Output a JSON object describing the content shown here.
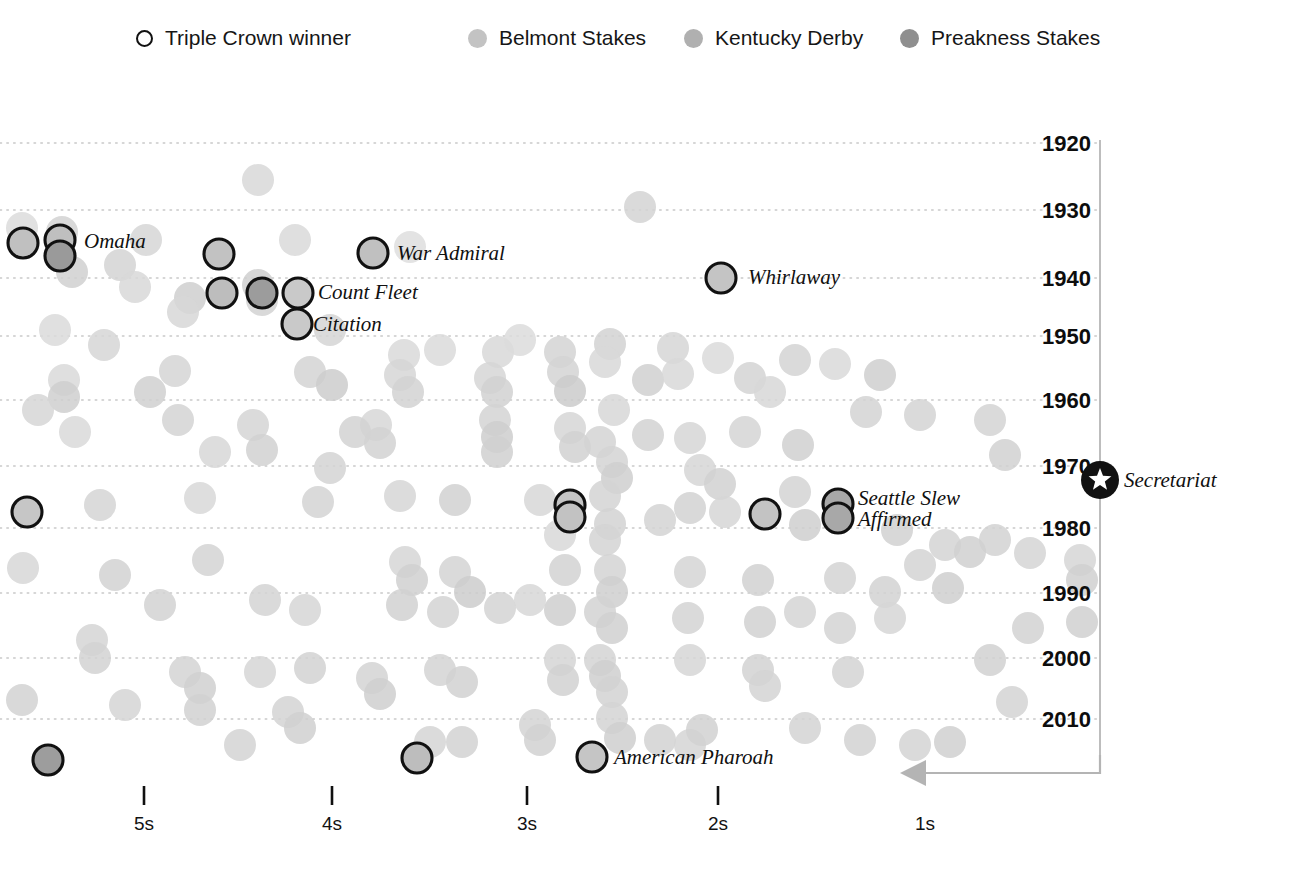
{
  "legend": {
    "items": [
      {
        "name": "triple-crown-winner",
        "label": "Triple Crown winner",
        "marker": "ring",
        "color": "#ffffff",
        "x": 136
      },
      {
        "name": "belmont-stakes",
        "label": "Belmont Stakes",
        "marker": "dot",
        "color": "#c3c3c3",
        "x": 468
      },
      {
        "name": "kentucky-derby",
        "label": "Kentucky Derby",
        "marker": "dot",
        "color": "#b0b0b0",
        "x": 684
      },
      {
        "name": "preakness-stakes",
        "label": "Preakness Stakes",
        "marker": "dot",
        "color": "#8f8f8f",
        "x": 900
      }
    ]
  },
  "chart_data": {
    "type": "scatter",
    "title": "",
    "xlabel": "",
    "ylabel": "",
    "grid": true,
    "legend_position": "top",
    "x_axis": {
      "ticks": [
        {
          "label": "5s",
          "x": 144,
          "has_tick": true
        },
        {
          "label": "4s",
          "x": 332,
          "has_tick": true
        },
        {
          "label": "3s",
          "x": 527,
          "has_tick": true
        },
        {
          "label": "2s",
          "x": 718,
          "has_tick": true
        },
        {
          "label": "1s",
          "x": 925,
          "has_tick": false
        }
      ],
      "tick_y_top": 786,
      "tick_y_bottom": 805,
      "label_y": 830,
      "direction_note": "seconds slower than record; decreasing to the right"
    },
    "y_axis": {
      "ticks": [
        {
          "label": "1920",
          "y": 143
        },
        {
          "label": "1930",
          "y": 210
        },
        {
          "label": "1940",
          "y": 278
        },
        {
          "label": "1950",
          "y": 336
        },
        {
          "label": "1960",
          "y": 400
        },
        {
          "label": "1970",
          "y": 466
        },
        {
          "label": "1980",
          "y": 528
        },
        {
          "label": "1990",
          "y": 593
        },
        {
          "label": "2000",
          "y": 658
        },
        {
          "label": "2010",
          "y": 719
        }
      ],
      "label_x": 1042,
      "axis_line_x": 1100,
      "axis_top": 140,
      "axis_bottom": 766
    },
    "series": [
      {
        "name": "Belmont Stakes",
        "color": "#c3c3c3"
      },
      {
        "name": "Kentucky Derby",
        "color": "#b0b0b0"
      },
      {
        "name": "Preakness Stakes",
        "color": "#8f8f8f"
      }
    ],
    "points": [
      [
        258,
        180,
        "#d8d8d8"
      ],
      [
        640,
        207,
        "#d3d3d3"
      ],
      [
        22,
        228,
        "#dcdcdc"
      ],
      [
        62,
        232,
        "#d2d2d2"
      ],
      [
        146,
        240,
        "#d6d6d6"
      ],
      [
        295,
        240,
        "#d9d9d9"
      ],
      [
        410,
        247,
        "#dedede"
      ],
      [
        120,
        265,
        "#d4d4d4"
      ],
      [
        72,
        272,
        "#d0d0d0"
      ],
      [
        135,
        287,
        "#d8d8d8"
      ],
      [
        190,
        298,
        "#cfcfcf"
      ],
      [
        183,
        312,
        "#d7d7d7"
      ],
      [
        258,
        285,
        "#cfcfcf"
      ],
      [
        262,
        300,
        "#d2d2d2"
      ],
      [
        55,
        330,
        "#dbdbdb"
      ],
      [
        104,
        345,
        "#d6d6d6"
      ],
      [
        330,
        330,
        "#d5d5d5"
      ],
      [
        404,
        355,
        "#d9d9d9"
      ],
      [
        440,
        350,
        "#dadada"
      ],
      [
        498,
        352,
        "#d8d8d8"
      ],
      [
        560,
        352,
        "#d3d3d3"
      ],
      [
        520,
        340,
        "#dcdcdc"
      ],
      [
        610,
        344,
        "#d2d2d2"
      ],
      [
        605,
        362,
        "#d8d8d8"
      ],
      [
        673,
        348,
        "#d6d6d6"
      ],
      [
        718,
        358,
        "#dadada"
      ],
      [
        795,
        360,
        "#d4d4d4"
      ],
      [
        835,
        364,
        "#d9d9d9"
      ],
      [
        64,
        380,
        "#d9d9d9"
      ],
      [
        64,
        397,
        "#cfcfcf"
      ],
      [
        150,
        392,
        "#d0d0d0"
      ],
      [
        175,
        371,
        "#d5d5d5"
      ],
      [
        310,
        372,
        "#d4d4d4"
      ],
      [
        332,
        385,
        "#cdcdcd"
      ],
      [
        400,
        375,
        "#d6d6d6"
      ],
      [
        408,
        392,
        "#d2d2d2"
      ],
      [
        490,
        378,
        "#d6d6d6"
      ],
      [
        497,
        392,
        "#d1d1d1"
      ],
      [
        563,
        372,
        "#d3d3d3"
      ],
      [
        570,
        391,
        "#cbcbcb"
      ],
      [
        648,
        380,
        "#d0d0d0"
      ],
      [
        678,
        374,
        "#d8d8d8"
      ],
      [
        750,
        378,
        "#d3d3d3"
      ],
      [
        770,
        392,
        "#d7d7d7"
      ],
      [
        880,
        375,
        "#cfcfcf"
      ],
      [
        920,
        415,
        "#d3d3d3"
      ],
      [
        990,
        420,
        "#d4d4d4"
      ],
      [
        178,
        420,
        "#d3d3d3"
      ],
      [
        75,
        432,
        "#d9d9d9"
      ],
      [
        253,
        425,
        "#d5d5d5"
      ],
      [
        262,
        450,
        "#d1d1d1"
      ],
      [
        376,
        425,
        "#d7d7d7"
      ],
      [
        380,
        443,
        "#d2d2d2"
      ],
      [
        495,
        420,
        "#d3d3d3"
      ],
      [
        497,
        437,
        "#cecece"
      ],
      [
        497,
        452,
        "#d0d0d0"
      ],
      [
        570,
        428,
        "#d6d6d6"
      ],
      [
        575,
        447,
        "#d1d1d1"
      ],
      [
        600,
        442,
        "#d4d4d4"
      ],
      [
        648,
        435,
        "#d2d2d2"
      ],
      [
        690,
        438,
        "#d6d6d6"
      ],
      [
        745,
        432,
        "#d5d5d5"
      ],
      [
        798,
        445,
        "#d0d0d0"
      ],
      [
        614,
        410,
        "#d7d7d7"
      ],
      [
        612,
        462,
        "#d3d3d3"
      ],
      [
        617,
        478,
        "#cfcfcf"
      ],
      [
        700,
        470,
        "#d6d6d6"
      ],
      [
        720,
        484,
        "#d1d1d1"
      ],
      [
        795,
        492,
        "#d3d3d3"
      ],
      [
        605,
        496,
        "#d4d4d4"
      ],
      [
        690,
        508,
        "#d2d2d2"
      ],
      [
        725,
        512,
        "#d6d6d6"
      ],
      [
        200,
        498,
        "#d8d8d8"
      ],
      [
        318,
        502,
        "#d3d3d3"
      ],
      [
        400,
        496,
        "#d6d6d6"
      ],
      [
        455,
        500,
        "#d1d1d1"
      ],
      [
        540,
        500,
        "#d7d7d7"
      ],
      [
        100,
        505,
        "#d5d5d5"
      ],
      [
        660,
        520,
        "#d3d3d3"
      ],
      [
        610,
        524,
        "#d2d2d2"
      ],
      [
        805,
        525,
        "#cfcfcf"
      ],
      [
        897,
        530,
        "#d1d1d1"
      ],
      [
        605,
        540,
        "#d4d4d4"
      ],
      [
        560,
        535,
        "#d8d8d8"
      ],
      [
        945,
        545,
        "#d4d4d4"
      ],
      [
        995,
        540,
        "#d2d2d2"
      ],
      [
        1030,
        553,
        "#d5d5d5"
      ],
      [
        920,
        565,
        "#d3d3d3"
      ],
      [
        970,
        552,
        "#d0d0d0"
      ],
      [
        23,
        568,
        "#d7d7d7"
      ],
      [
        115,
        575,
        "#d2d2d2"
      ],
      [
        208,
        560,
        "#d4d4d4"
      ],
      [
        405,
        562,
        "#d6d6d6"
      ],
      [
        412,
        580,
        "#d0d0d0"
      ],
      [
        455,
        572,
        "#d3d3d3"
      ],
      [
        470,
        592,
        "#cdcdcd"
      ],
      [
        565,
        570,
        "#d2d2d2"
      ],
      [
        610,
        570,
        "#d4d4d4"
      ],
      [
        612,
        592,
        "#cfcfcf"
      ],
      [
        690,
        572,
        "#d5d5d5"
      ],
      [
        758,
        580,
        "#d1d1d1"
      ],
      [
        840,
        578,
        "#d4d4d4"
      ],
      [
        885,
        592,
        "#d2d2d2"
      ],
      [
        948,
        588,
        "#cfcfcf"
      ],
      [
        1080,
        560,
        "#d6d6d6"
      ],
      [
        1082,
        580,
        "#d0d0d0"
      ],
      [
        160,
        605,
        "#d2d2d2"
      ],
      [
        265,
        600,
        "#d4d4d4"
      ],
      [
        305,
        610,
        "#d6d6d6"
      ],
      [
        402,
        605,
        "#d1d1d1"
      ],
      [
        443,
        612,
        "#d4d4d4"
      ],
      [
        500,
        608,
        "#d3d3d3"
      ],
      [
        530,
        600,
        "#d7d7d7"
      ],
      [
        560,
        610,
        "#cfcfcf"
      ],
      [
        600,
        612,
        "#d2d2d2"
      ],
      [
        612,
        628,
        "#d0d0d0"
      ],
      [
        688,
        618,
        "#d4d4d4"
      ],
      [
        760,
        622,
        "#d1d1d1"
      ],
      [
        800,
        612,
        "#d5d5d5"
      ],
      [
        840,
        628,
        "#d3d3d3"
      ],
      [
        890,
        618,
        "#d6d6d6"
      ],
      [
        1028,
        628,
        "#d2d2d2"
      ],
      [
        1082,
        622,
        "#d0d0d0"
      ],
      [
        92,
        640,
        "#d5d5d5"
      ],
      [
        95,
        658,
        "#d2d2d2"
      ],
      [
        185,
        672,
        "#d4d4d4"
      ],
      [
        200,
        688,
        "#d0d0d0"
      ],
      [
        260,
        672,
        "#d6d6d6"
      ],
      [
        310,
        668,
        "#d2d2d2"
      ],
      [
        372,
        678,
        "#d4d4d4"
      ],
      [
        380,
        694,
        "#cfcfcf"
      ],
      [
        440,
        670,
        "#d3d3d3"
      ],
      [
        462,
        682,
        "#d1d1d1"
      ],
      [
        560,
        660,
        "#d5d5d5"
      ],
      [
        563,
        680,
        "#d1d1d1"
      ],
      [
        600,
        660,
        "#d3d3d3"
      ],
      [
        605,
        676,
        "#cfcfcf"
      ],
      [
        612,
        692,
        "#d2d2d2"
      ],
      [
        690,
        660,
        "#d6d6d6"
      ],
      [
        758,
        670,
        "#d2d2d2"
      ],
      [
        765,
        686,
        "#d4d4d4"
      ],
      [
        848,
        672,
        "#d3d3d3"
      ],
      [
        990,
        660,
        "#d1d1d1"
      ],
      [
        1012,
        702,
        "#d4d4d4"
      ],
      [
        22,
        700,
        "#d2d2d2"
      ],
      [
        125,
        705,
        "#d5d5d5"
      ],
      [
        200,
        710,
        "#d1d1d1"
      ],
      [
        240,
        745,
        "#d3d3d3"
      ],
      [
        288,
        712,
        "#d4d4d4"
      ],
      [
        300,
        728,
        "#d0d0d0"
      ],
      [
        430,
        742,
        "#d5d5d5"
      ],
      [
        462,
        742,
        "#d2d2d2"
      ],
      [
        535,
        725,
        "#d4d4d4"
      ],
      [
        540,
        740,
        "#d1d1d1"
      ],
      [
        612,
        718,
        "#d3d3d3"
      ],
      [
        620,
        738,
        "#cfcfcf"
      ],
      [
        660,
        740,
        "#d2d2d2"
      ],
      [
        690,
        745,
        "#d5d5d5"
      ],
      [
        702,
        730,
        "#d1d1d1"
      ],
      [
        805,
        728,
        "#d4d4d4"
      ],
      [
        860,
        740,
        "#d2d2d2"
      ],
      [
        915,
        745,
        "#d3d3d3"
      ],
      [
        950,
        742,
        "#d0d0d0"
      ],
      [
        38,
        410,
        "#d6d6d6"
      ],
      [
        215,
        452,
        "#d7d7d7"
      ],
      [
        330,
        468,
        "#d4d4d4"
      ],
      [
        355,
        432,
        "#d2d2d2"
      ],
      [
        866,
        412,
        "#d3d3d3"
      ],
      [
        1005,
        455,
        "#d1d1d1"
      ]
    ],
    "triple_crown_winners": [
      {
        "name": "Sir Barton",
        "label": "",
        "x": 23,
        "y": 243,
        "fill": "#c0c0c0"
      },
      {
        "name": "Gallant Fox",
        "label": "",
        "x": 60,
        "y": 240,
        "fill": "#bfbfbf"
      },
      {
        "name": "Omaha",
        "label": "Omaha",
        "x": 60,
        "y": 256,
        "fill": "#9a9a9a",
        "label_x": 84,
        "label_y": 248
      },
      {
        "name": "War Admiral-a",
        "label": "",
        "x": 219,
        "y": 254,
        "fill": "#c2c2c2"
      },
      {
        "name": "War Admiral",
        "label": "War Admiral",
        "x": 373,
        "y": 253,
        "fill": "#c0c0c0",
        "label_x": 397,
        "label_y": 260
      },
      {
        "name": "Whirlaway",
        "label": "Whirlaway",
        "x": 721,
        "y": 278,
        "fill": "#c4c4c4",
        "label_x": 748,
        "label_y": 284
      },
      {
        "name": "Count Fleet-a",
        "label": "",
        "x": 222,
        "y": 293,
        "fill": "#bdbdbd"
      },
      {
        "name": "Count Fleet-b",
        "label": "",
        "x": 262,
        "y": 293,
        "fill": "#9c9c9c"
      },
      {
        "name": "Count Fleet",
        "label": "Count Fleet",
        "x": 298,
        "y": 293,
        "fill": "#c9c9c9",
        "label_x": 318,
        "label_y": 299
      },
      {
        "name": "Citation",
        "label": "Citation",
        "x": 297,
        "y": 324,
        "fill": "#c9c9c9",
        "label_x": 313,
        "label_y": 331
      },
      {
        "name": "unnamed-1977",
        "label": "",
        "x": 27,
        "y": 512,
        "fill": "#c6c6c6"
      },
      {
        "name": "unnamed-1977b",
        "label": "",
        "x": 570,
        "y": 505,
        "fill": "#c4c4c4"
      },
      {
        "name": "unnamed-1977c",
        "label": "",
        "x": 570,
        "y": 517,
        "fill": "#c2c2c2"
      },
      {
        "name": "unnamed-1978",
        "label": "",
        "x": 765,
        "y": 514,
        "fill": "#c3c3c3"
      },
      {
        "name": "Seattle Slew",
        "label": "Seattle Slew",
        "x": 838,
        "y": 504,
        "fill": "#a8a8a8",
        "label_x": 858,
        "label_y": 505
      },
      {
        "name": "Affirmed",
        "label": "Affirmed",
        "x": 838,
        "y": 518,
        "fill": "#a8a8a8",
        "label_x": 858,
        "label_y": 526
      },
      {
        "name": "american-pharoah-a",
        "label": "",
        "x": 48,
        "y": 760,
        "fill": "#9d9d9d"
      },
      {
        "name": "american-pharoah-b",
        "label": "",
        "x": 417,
        "y": 758,
        "fill": "#bdbdbd"
      },
      {
        "name": "American Pharoah",
        "label": "American Pharoah",
        "x": 592,
        "y": 757,
        "fill": "#c5c5c5",
        "label_x": 614,
        "label_y": 764
      }
    ],
    "secretariat": {
      "label": "Secretariat",
      "x": 1100,
      "y": 480,
      "label_x": 1124,
      "label_y": 487,
      "marker": "star-in-circle"
    },
    "annotation_arrow": {
      "from_x": 1100,
      "from_y": 755,
      "corner_y": 773,
      "to_x": 900,
      "color": "#b4b4b4"
    }
  }
}
